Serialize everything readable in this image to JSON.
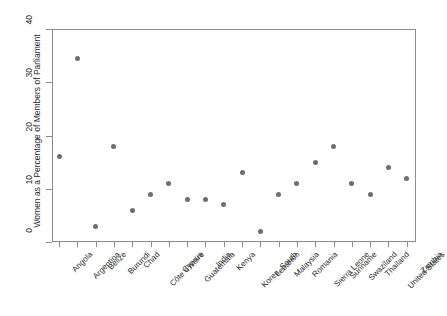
{
  "chart_data": {
    "type": "scatter",
    "title": "",
    "xlabel": "",
    "ylabel": "Women as a Percentage of Members of Parliament",
    "ylim": [
      0,
      40
    ],
    "yticks": [
      0,
      10,
      20,
      30,
      40
    ],
    "grid": false,
    "legend": "none",
    "marker_color": "#6e6e6e",
    "axis_color": "#8c8c8c",
    "categories": [
      "Angola",
      "Argentina",
      "Belize",
      "Burundi",
      "Chad",
      "Côte d'Ivoire",
      "Cyprus",
      "Guatemala",
      "India",
      "Kenya",
      "Korea, South",
      "Lebanon",
      "Malaysia",
      "Romania",
      "Sierra Leone",
      "Suriname",
      "Swaziland",
      "Thailand",
      "United States",
      "Zambia"
    ],
    "values": [
      16,
      34.5,
      3,
      18,
      6,
      9,
      11,
      8,
      8,
      7,
      13,
      2,
      9,
      11,
      15,
      18,
      11,
      9,
      14,
      12
    ]
  }
}
